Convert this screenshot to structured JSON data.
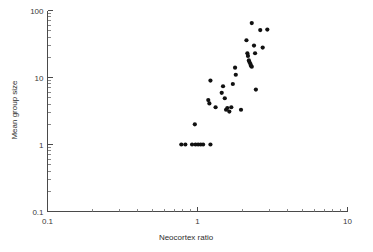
{
  "chart_data": {
    "type": "scatter",
    "title": "",
    "xlabel": "Neocortex ratio",
    "ylabel": "Mean group size",
    "xscale": "log",
    "yscale": "log",
    "xlim": [
      0.1,
      10
    ],
    "ylim": [
      0.1,
      100
    ],
    "grid": false,
    "legend": null,
    "xticks": [
      0.1,
      1,
      10
    ],
    "xticklabels": [
      "0.1",
      "1",
      "10"
    ],
    "yticks": [
      0.1,
      1,
      10,
      100
    ],
    "yticklabels": [
      "0.1",
      "1",
      "10",
      "100"
    ],
    "marker": "filled-circle",
    "marker_color": "#111111",
    "marker_size_px": 2.1,
    "points": [
      {
        "x": 0.78,
        "y": 1.0
      },
      {
        "x": 0.83,
        "y": 1.0
      },
      {
        "x": 0.92,
        "y": 1.0
      },
      {
        "x": 0.97,
        "y": 1.0
      },
      {
        "x": 1.01,
        "y": 1.0
      },
      {
        "x": 1.05,
        "y": 1.0
      },
      {
        "x": 1.09,
        "y": 1.0
      },
      {
        "x": 1.22,
        "y": 1.0
      },
      {
        "x": 0.96,
        "y": 2.0
      },
      {
        "x": 1.18,
        "y": 4.6
      },
      {
        "x": 1.2,
        "y": 4.1
      },
      {
        "x": 1.22,
        "y": 9.0
      },
      {
        "x": 1.32,
        "y": 3.6
      },
      {
        "x": 1.45,
        "y": 5.9
      },
      {
        "x": 1.48,
        "y": 7.4
      },
      {
        "x": 1.52,
        "y": 4.9
      },
      {
        "x": 1.55,
        "y": 3.3
      },
      {
        "x": 1.58,
        "y": 3.5
      },
      {
        "x": 1.63,
        "y": 3.1
      },
      {
        "x": 1.68,
        "y": 3.6
      },
      {
        "x": 1.72,
        "y": 8.0
      },
      {
        "x": 1.78,
        "y": 14.0
      },
      {
        "x": 1.8,
        "y": 11.0
      },
      {
        "x": 1.95,
        "y": 3.3
      },
      {
        "x": 2.12,
        "y": 36.0
      },
      {
        "x": 2.15,
        "y": 23.0
      },
      {
        "x": 2.17,
        "y": 21.0
      },
      {
        "x": 2.2,
        "y": 18.0
      },
      {
        "x": 2.22,
        "y": 17.0
      },
      {
        "x": 2.25,
        "y": 16.0
      },
      {
        "x": 2.27,
        "y": 15.0
      },
      {
        "x": 2.3,
        "y": 14.5
      },
      {
        "x": 2.3,
        "y": 65.0
      },
      {
        "x": 2.38,
        "y": 30.0
      },
      {
        "x": 2.42,
        "y": 23.0
      },
      {
        "x": 2.45,
        "y": 6.6
      },
      {
        "x": 2.62,
        "y": 51.0
      },
      {
        "x": 2.72,
        "y": 28.0
      },
      {
        "x": 2.92,
        "y": 52.0
      }
    ]
  },
  "axes": {
    "x_title": "Neocortex ratio",
    "y_title": "Mean group size"
  }
}
